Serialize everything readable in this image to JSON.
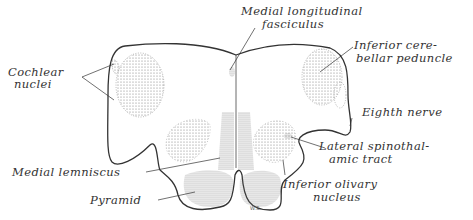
{
  "figure": {
    "type": "anatomical cross-section diagram",
    "signature": "W.S.",
    "labels": {
      "medial_longitudinal_fasciculus": [
        "Medial longitudinal",
        "fasciculus"
      ],
      "cochlear_nuclei": [
        "Cochlear",
        "nuclei"
      ],
      "inferior_cerebellar_peduncle": [
        "Inferior cere-",
        "bellar peduncle"
      ],
      "eighth_nerve": "Eighth nerve",
      "lateral_spinothalamic_tract": [
        "Lateral spinothal-",
        "amic tract"
      ],
      "medial_lemniscus": "Medial lemniscus",
      "inferior_olivary_nucleus": [
        "Inferior olivary",
        "nucleus"
      ],
      "pyramid": "Pyramid"
    },
    "colors": {
      "ink": "#333333",
      "stipple": "#777777",
      "background": "#ffffff"
    }
  }
}
